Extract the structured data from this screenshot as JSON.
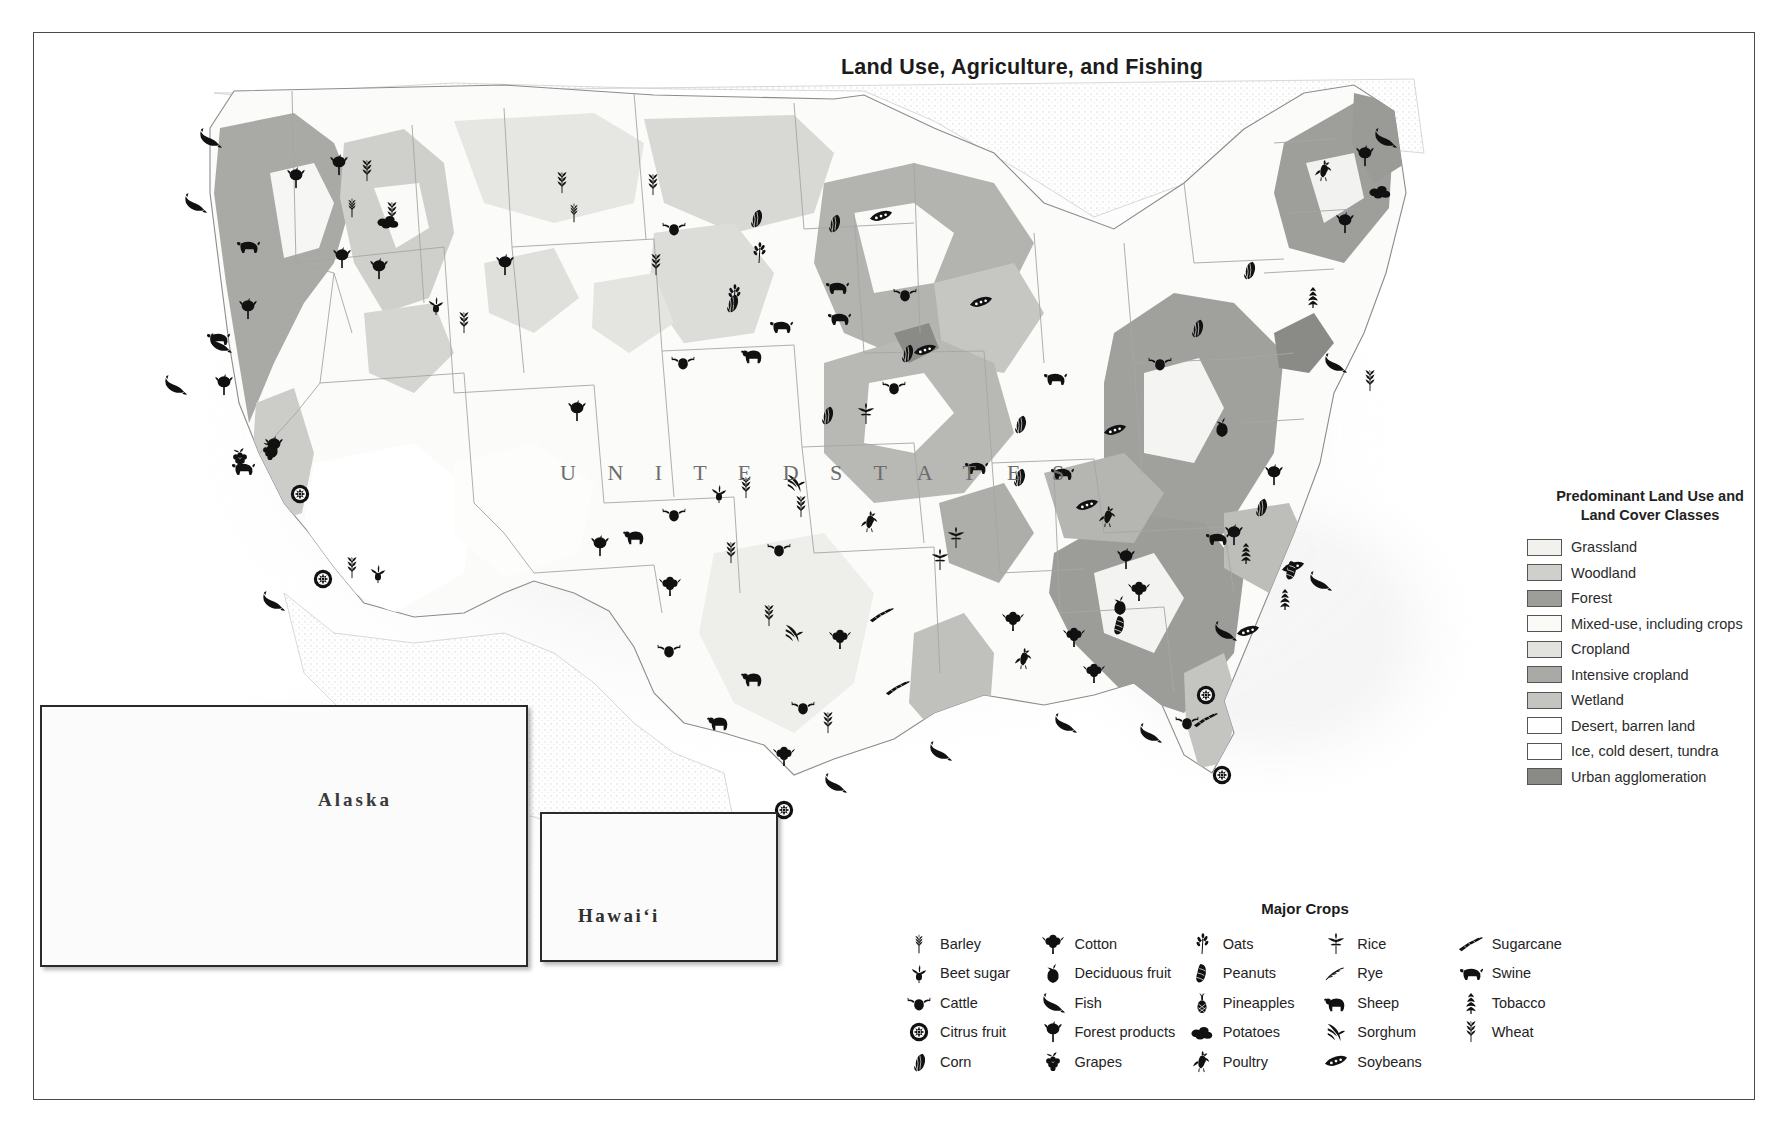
{
  "title": "Land Use, Agriculture, and Fishing",
  "map_labels": {
    "country": "U N I T E D   S T A T E S",
    "alaska": "Alaska",
    "hawaii": "Hawaiʻi"
  },
  "landuse_legend": {
    "title_line1": "Predominant Land Use and",
    "title_line2": "Land Cover Classes",
    "classes": [
      {
        "label": "Grassland",
        "color": "#f2f1ee"
      },
      {
        "label": "Woodland",
        "color": "#cfcfcb"
      },
      {
        "label": "Forest",
        "color": "#9d9d9a"
      },
      {
        "label": "Mixed-use, including crops",
        "color": "#fafaf7"
      },
      {
        "label": "Cropland",
        "color": "#e2e2de"
      },
      {
        "label": "Intensive cropland",
        "color": "#a9a9a5"
      },
      {
        "label": "Wetland",
        "color": "#c4c4c0"
      },
      {
        "label": "Desert, barren land",
        "color": "#ffffff"
      },
      {
        "label": "Ice, cold desert, tundra",
        "color": "#ffffff"
      },
      {
        "label": "Urban agglomeration",
        "color": "#8a8a87"
      }
    ]
  },
  "crops_legend": {
    "title": "Major Crops",
    "columns": [
      [
        {
          "label": "Barley",
          "icon": "barley-icon"
        },
        {
          "label": "Beet sugar",
          "icon": "beet-sugar-icon"
        },
        {
          "label": "Cattle",
          "icon": "cattle-icon"
        },
        {
          "label": "Citrus fruit",
          "icon": "citrus-fruit-icon"
        },
        {
          "label": "Corn",
          "icon": "corn-icon"
        }
      ],
      [
        {
          "label": "Cotton",
          "icon": "cotton-icon"
        },
        {
          "label": "Deciduous fruit",
          "icon": "deciduous-fruit-icon"
        },
        {
          "label": "Fish",
          "icon": "fish-icon"
        },
        {
          "label": "Forest products",
          "icon": "forest-products-icon"
        },
        {
          "label": "Grapes",
          "icon": "grapes-icon"
        }
      ],
      [
        {
          "label": "Oats",
          "icon": "oats-icon"
        },
        {
          "label": "Peanuts",
          "icon": "peanuts-icon"
        },
        {
          "label": "Pineapples",
          "icon": "pineapples-icon"
        },
        {
          "label": "Potatoes",
          "icon": "potatoes-icon"
        },
        {
          "label": "Poultry",
          "icon": "poultry-icon"
        }
      ],
      [
        {
          "label": "Rice",
          "icon": "rice-icon"
        },
        {
          "label": "Rye",
          "icon": "rye-icon"
        },
        {
          "label": "Sheep",
          "icon": "sheep-icon"
        },
        {
          "label": "Sorghum",
          "icon": "sorghum-icon"
        },
        {
          "label": "Soybeans",
          "icon": "soybeans-icon"
        }
      ],
      [
        {
          "label": "Sugarcane",
          "icon": "sugarcane-icon"
        },
        {
          "label": "Swine",
          "icon": "swine-icon"
        },
        {
          "label": "Tobacco",
          "icon": "tobacco-icon"
        },
        {
          "label": "Wheat",
          "icon": "wheat-icon"
        }
      ]
    ]
  },
  "colors": {
    "frame": "#4a4a4a",
    "water": "#ffffff",
    "state_border": "#9a9a9a",
    "coast": "#777777",
    "symbol": "#111111"
  },
  "map_symbols": [
    {
      "icon": "fish-icon",
      "x": 175,
      "y": 105
    },
    {
      "icon": "fish-icon",
      "x": 160,
      "y": 170
    },
    {
      "icon": "fish-icon",
      "x": 140,
      "y": 352
    },
    {
      "icon": "fish-icon",
      "x": 185,
      "y": 310
    },
    {
      "icon": "fish-icon",
      "x": 238,
      "y": 568
    },
    {
      "icon": "fish-icon",
      "x": 800,
      "y": 750
    },
    {
      "icon": "fish-icon",
      "x": 905,
      "y": 718
    },
    {
      "icon": "fish-icon",
      "x": 1030,
      "y": 690
    },
    {
      "icon": "fish-icon",
      "x": 1115,
      "y": 700
    },
    {
      "icon": "fish-icon",
      "x": 1190,
      "y": 598
    },
    {
      "icon": "fish-icon",
      "x": 1285,
      "y": 548
    },
    {
      "icon": "fish-icon",
      "x": 1300,
      "y": 330
    },
    {
      "icon": "fish-icon",
      "x": 1350,
      "y": 105
    },
    {
      "icon": "forest-products-icon",
      "x": 262,
      "y": 145
    },
    {
      "icon": "forest-products-icon",
      "x": 305,
      "y": 132
    },
    {
      "icon": "forest-products-icon",
      "x": 308,
      "y": 225
    },
    {
      "icon": "forest-products-icon",
      "x": 345,
      "y": 236
    },
    {
      "icon": "forest-products-icon",
      "x": 214,
      "y": 276
    },
    {
      "icon": "forest-products-icon",
      "x": 190,
      "y": 352
    },
    {
      "icon": "forest-products-icon",
      "x": 240,
      "y": 414
    },
    {
      "icon": "forest-products-icon",
      "x": 471,
      "y": 232
    },
    {
      "icon": "forest-products-icon",
      "x": 543,
      "y": 378
    },
    {
      "icon": "forest-products-icon",
      "x": 566,
      "y": 513
    },
    {
      "icon": "forest-products-icon",
      "x": 1200,
      "y": 502
    },
    {
      "icon": "forest-products-icon",
      "x": 1240,
      "y": 442
    },
    {
      "icon": "forest-products-icon",
      "x": 1092,
      "y": 526
    },
    {
      "icon": "forest-products-icon",
      "x": 1331,
      "y": 123
    },
    {
      "icon": "forest-products-icon",
      "x": 1311,
      "y": 190
    },
    {
      "icon": "wheat-icon",
      "x": 333,
      "y": 138
    },
    {
      "icon": "wheat-icon",
      "x": 358,
      "y": 180
    },
    {
      "icon": "wheat-icon",
      "x": 430,
      "y": 290
    },
    {
      "icon": "wheat-icon",
      "x": 528,
      "y": 150
    },
    {
      "icon": "wheat-icon",
      "x": 619,
      "y": 152
    },
    {
      "icon": "wheat-icon",
      "x": 622,
      "y": 232
    },
    {
      "icon": "wheat-icon",
      "x": 712,
      "y": 455
    },
    {
      "icon": "wheat-icon",
      "x": 767,
      "y": 474
    },
    {
      "icon": "wheat-icon",
      "x": 697,
      "y": 520
    },
    {
      "icon": "wheat-icon",
      "x": 735,
      "y": 583
    },
    {
      "icon": "wheat-icon",
      "x": 794,
      "y": 690
    },
    {
      "icon": "wheat-icon",
      "x": 318,
      "y": 535
    },
    {
      "icon": "wheat-icon",
      "x": 1336,
      "y": 348
    },
    {
      "icon": "cattle-icon",
      "x": 639,
      "y": 196
    },
    {
      "icon": "cattle-icon",
      "x": 648,
      "y": 330
    },
    {
      "icon": "cattle-icon",
      "x": 639,
      "y": 482
    },
    {
      "icon": "cattle-icon",
      "x": 744,
      "y": 517
    },
    {
      "icon": "cattle-icon",
      "x": 634,
      "y": 618
    },
    {
      "icon": "cattle-icon",
      "x": 768,
      "y": 675
    },
    {
      "icon": "cattle-icon",
      "x": 870,
      "y": 262
    },
    {
      "icon": "cattle-icon",
      "x": 859,
      "y": 355
    },
    {
      "icon": "cattle-icon",
      "x": 1125,
      "y": 331
    },
    {
      "icon": "cattle-icon",
      "x": 1152,
      "y": 690
    },
    {
      "icon": "sheep-icon",
      "x": 718,
      "y": 323
    },
    {
      "icon": "sheep-icon",
      "x": 600,
      "y": 504
    },
    {
      "icon": "sheep-icon",
      "x": 718,
      "y": 646
    },
    {
      "icon": "sheep-icon",
      "x": 684,
      "y": 690
    },
    {
      "icon": "swine-icon",
      "x": 213,
      "y": 215
    },
    {
      "icon": "swine-icon",
      "x": 183,
      "y": 307
    },
    {
      "icon": "swine-icon",
      "x": 208,
      "y": 437
    },
    {
      "icon": "swine-icon",
      "x": 746,
      "y": 295
    },
    {
      "icon": "swine-icon",
      "x": 802,
      "y": 256
    },
    {
      "icon": "swine-icon",
      "x": 804,
      "y": 287
    },
    {
      "icon": "swine-icon",
      "x": 941,
      "y": 436
    },
    {
      "icon": "swine-icon",
      "x": 1020,
      "y": 347
    },
    {
      "icon": "swine-icon",
      "x": 1027,
      "y": 442
    },
    {
      "icon": "swine-icon",
      "x": 1182,
      "y": 507
    },
    {
      "icon": "citrus-fruit-icon",
      "x": 266,
      "y": 461
    },
    {
      "icon": "citrus-fruit-icon",
      "x": 289,
      "y": 546
    },
    {
      "icon": "citrus-fruit-icon",
      "x": 750,
      "y": 777
    },
    {
      "icon": "citrus-fruit-icon",
      "x": 1172,
      "y": 662
    },
    {
      "icon": "citrus-fruit-icon",
      "x": 1188,
      "y": 742
    },
    {
      "icon": "corn-icon",
      "x": 698,
      "y": 270
    },
    {
      "icon": "corn-icon",
      "x": 722,
      "y": 185
    },
    {
      "icon": "corn-icon",
      "x": 800,
      "y": 190
    },
    {
      "icon": "corn-icon",
      "x": 873,
      "y": 320
    },
    {
      "icon": "corn-icon",
      "x": 793,
      "y": 382
    },
    {
      "icon": "corn-icon",
      "x": 986,
      "y": 391
    },
    {
      "icon": "corn-icon",
      "x": 985,
      "y": 444
    },
    {
      "icon": "corn-icon",
      "x": 1227,
      "y": 474
    },
    {
      "icon": "corn-icon",
      "x": 1163,
      "y": 295
    },
    {
      "icon": "corn-icon",
      "x": 1215,
      "y": 237
    },
    {
      "icon": "soybeans-icon",
      "x": 890,
      "y": 320
    },
    {
      "icon": "soybeans-icon",
      "x": 846,
      "y": 186
    },
    {
      "icon": "soybeans-icon",
      "x": 1080,
      "y": 400
    },
    {
      "icon": "soybeans-icon",
      "x": 946,
      "y": 272
    },
    {
      "icon": "soybeans-icon",
      "x": 1052,
      "y": 475
    },
    {
      "icon": "soybeans-icon",
      "x": 1213,
      "y": 601
    },
    {
      "icon": "soybeans-icon",
      "x": 1258,
      "y": 537
    },
    {
      "icon": "cotton-icon",
      "x": 636,
      "y": 553
    },
    {
      "icon": "cotton-icon",
      "x": 806,
      "y": 606
    },
    {
      "icon": "cotton-icon",
      "x": 750,
      "y": 723
    },
    {
      "icon": "cotton-icon",
      "x": 979,
      "y": 588
    },
    {
      "icon": "cotton-icon",
      "x": 1040,
      "y": 604
    },
    {
      "icon": "cotton-icon",
      "x": 1060,
      "y": 640
    },
    {
      "icon": "cotton-icon",
      "x": 1105,
      "y": 558
    },
    {
      "icon": "poultry-icon",
      "x": 836,
      "y": 489
    },
    {
      "icon": "poultry-icon",
      "x": 1074,
      "y": 484
    },
    {
      "icon": "poultry-icon",
      "x": 990,
      "y": 626
    },
    {
      "icon": "poultry-icon",
      "x": 1290,
      "y": 138
    },
    {
      "icon": "rice-icon",
      "x": 832,
      "y": 381
    },
    {
      "icon": "rice-icon",
      "x": 906,
      "y": 527
    },
    {
      "icon": "rice-icon",
      "x": 922,
      "y": 505
    },
    {
      "icon": "sugarcane-icon",
      "x": 846,
      "y": 585
    },
    {
      "icon": "sugarcane-icon",
      "x": 862,
      "y": 658
    },
    {
      "icon": "sugarcane-icon",
      "x": 1170,
      "y": 690
    },
    {
      "icon": "peanuts-icon",
      "x": 1086,
      "y": 592
    },
    {
      "icon": "peanuts-icon",
      "x": 1258,
      "y": 537
    },
    {
      "icon": "tobacco-icon",
      "x": 1212,
      "y": 520
    },
    {
      "icon": "tobacco-icon",
      "x": 1279,
      "y": 264
    },
    {
      "icon": "tobacco-icon",
      "x": 1251,
      "y": 566
    },
    {
      "icon": "potatoes-icon",
      "x": 353,
      "y": 190
    },
    {
      "icon": "potatoes-icon",
      "x": 1345,
      "y": 160
    },
    {
      "icon": "grapes-icon",
      "x": 206,
      "y": 425
    },
    {
      "icon": "grapes-icon",
      "x": 236,
      "y": 418
    },
    {
      "icon": "beet-sugar-icon",
      "x": 402,
      "y": 272
    },
    {
      "icon": "beet-sugar-icon",
      "x": 344,
      "y": 540
    },
    {
      "icon": "beet-sugar-icon",
      "x": 685,
      "y": 460
    },
    {
      "icon": "sorghum-icon",
      "x": 762,
      "y": 450
    },
    {
      "icon": "sorghum-icon",
      "x": 760,
      "y": 600
    },
    {
      "icon": "barley-icon",
      "x": 318,
      "y": 175
    },
    {
      "icon": "barley-icon",
      "x": 540,
      "y": 180
    },
    {
      "icon": "oats-icon",
      "x": 725,
      "y": 220
    },
    {
      "icon": "oats-icon",
      "x": 700,
      "y": 262
    },
    {
      "icon": "deciduous-fruit-icon",
      "x": 238,
      "y": 415
    },
    {
      "icon": "deciduous-fruit-icon",
      "x": 1188,
      "y": 394
    },
    {
      "icon": "deciduous-fruit-icon",
      "x": 1086,
      "y": 572
    }
  ]
}
